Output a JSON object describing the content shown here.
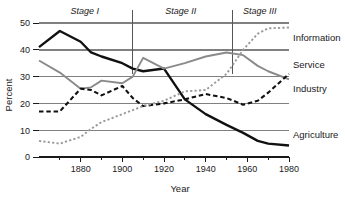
{
  "chart_data": {
    "type": "line",
    "title": "",
    "xlabel": "Year",
    "ylabel": "Percent",
    "xlim": [
      1860,
      1980
    ],
    "ylim": [
      0,
      50
    ],
    "grid": true,
    "legend_position": "right-inline",
    "x_ticks_major": [
      1880,
      1900,
      1920,
      1940,
      1960,
      1980
    ],
    "x_ticks_major_labels": [
      "1880",
      "1900",
      "1920",
      "1940",
      "1960",
      "1980"
    ],
    "x_ticks_minor": [
      1870,
      1890,
      1910,
      1930,
      1950,
      1970
    ],
    "y_ticks": [
      0,
      10,
      20,
      30,
      40,
      50
    ],
    "y_tick_labels": [
      "0",
      "10",
      "20",
      "30",
      "40",
      "50"
    ],
    "annotations": [
      {
        "text": "Stage I",
        "x": 1882,
        "style": "italic"
      },
      {
        "text": "Stage II",
        "x": 1928,
        "style": "italic"
      },
      {
        "text": "Stage III",
        "x": 1966,
        "style": "italic"
      }
    ],
    "stage_dividers": [
      1905,
      1953
    ],
    "x": [
      1860,
      1870,
      1880,
      1885,
      1890,
      1900,
      1905,
      1910,
      1920,
      1930,
      1940,
      1950,
      1958,
      1965,
      1970,
      1980
    ],
    "series": [
      {
        "name": "Agriculture",
        "style": "solid",
        "color": "#111111",
        "width": 2.4,
        "values": [
          41,
          47,
          43,
          39,
          37.5,
          35,
          33,
          32,
          33,
          21.5,
          16,
          12,
          9,
          6,
          5,
          4.3
        ]
      },
      {
        "name": "Service",
        "style": "solid",
        "color": "#8a8a8a",
        "width": 1.9,
        "values": [
          36,
          31.5,
          25.5,
          26,
          28.5,
          27.5,
          30,
          37,
          33,
          35,
          37.5,
          39,
          38,
          34,
          32,
          29
        ]
      },
      {
        "name": "Industry",
        "style": "dashed",
        "color": "#111111",
        "width": 2.1,
        "values": [
          17,
          17,
          25.5,
          25,
          23,
          26.5,
          22,
          19,
          20,
          21.5,
          23.5,
          22,
          19.5,
          21,
          24,
          31
        ]
      },
      {
        "name": "Information",
        "style": "dotted",
        "color": "#9a9a9a",
        "width": 1.9,
        "values": [
          6,
          5,
          7.5,
          10.5,
          13,
          16,
          17.5,
          19,
          21,
          24.5,
          25,
          31,
          40,
          46,
          48,
          48.3
        ]
      }
    ],
    "series_labels": [
      {
        "name": "Information",
        "y_at_label": 44.5
      },
      {
        "name": "Service",
        "y_at_label": 34.5
      },
      {
        "name": "Industry",
        "y_at_label": 25.5
      },
      {
        "name": "Agriculture",
        "y_at_label": 8.5
      }
    ]
  }
}
